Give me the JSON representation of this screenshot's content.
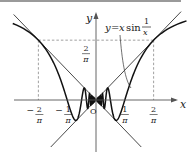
{
  "diagram": {
    "function_label": {
      "lhs": "y",
      "eq": "=",
      "x": "x",
      "sin": "sin",
      "num": "1",
      "den": "x"
    },
    "axis_labels": {
      "x": "x",
      "y": "y",
      "origin": "O"
    },
    "x_ticks": [
      {
        "value": -0.63662,
        "sign": "−",
        "num": "2",
        "den": "π"
      },
      {
        "value": -0.31831,
        "sign": "−",
        "num": "1",
        "den": "π"
      },
      {
        "value": 0.31831,
        "sign": "",
        "num": "1",
        "den": "π"
      },
      {
        "value": 0.63662,
        "sign": "",
        "num": "2",
        "den": "π"
      }
    ],
    "y_tick": {
      "value": 0.63662,
      "num": "2",
      "den": "π"
    },
    "curves": [
      "y = x sin(1/x)",
      "y = x",
      "y = -x"
    ],
    "x_range": [
      -0.91,
      1.0
    ],
    "y_range": [
      -0.55,
      0.9
    ],
    "colors": {
      "curve": "#111111",
      "line": "#333333",
      "dashed": "#777777"
    }
  }
}
